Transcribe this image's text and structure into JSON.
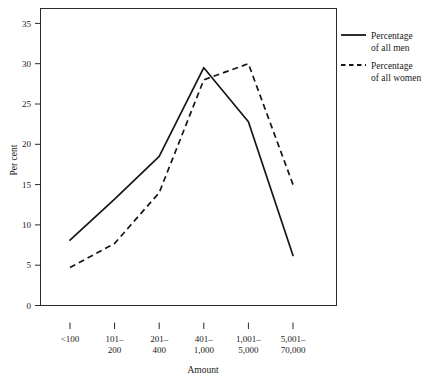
{
  "chart_data": {
    "type": "line",
    "title": "",
    "xlabel": "Amount",
    "ylabel": "Per cent",
    "categories": [
      "<100",
      "101–\n200",
      "201–\n400",
      "401–\n1,000",
      "1,001–\n5,000",
      "5,001–\n70,000"
    ],
    "categories_flat": [
      "<100",
      "101–200",
      "201–400",
      "401–1,000",
      "1,001–5,000",
      "5,001–70,000"
    ],
    "category_lines": [
      [
        "<100"
      ],
      [
        "101–",
        "200"
      ],
      [
        "201–",
        "400"
      ],
      [
        "401–",
        "1,000"
      ],
      [
        "1,001–",
        "5,000"
      ],
      [
        "5,001–",
        "70,000"
      ]
    ],
    "series": [
      {
        "name": "Percentage of all men",
        "style": "solid",
        "color": "#15151a",
        "values": [
          8.1,
          13.2,
          18.5,
          29.5,
          22.8,
          6.2
        ]
      },
      {
        "name": "Percentage of all women",
        "style": "dashed",
        "color": "#15151a",
        "values": [
          4.7,
          7.7,
          14.0,
          28.0,
          30.0,
          15.0
        ]
      }
    ],
    "ylim": [
      0,
      35
    ],
    "yticks": [
      0,
      5,
      10,
      15,
      20,
      25,
      30,
      35
    ],
    "ytick_labels": [
      "0",
      "5",
      "10",
      "15",
      "20",
      "25",
      "30",
      "35"
    ],
    "grid": false,
    "legend_position": "right"
  },
  "legend": {
    "entries": [
      {
        "label_line1": "Percentage",
        "label_line2": "of all men",
        "style": "solid"
      },
      {
        "label_line1": "Percentage",
        "label_line2": "of all women",
        "style": "dashed"
      }
    ]
  },
  "axes": {
    "x_title": "Amount",
    "y_title": "Per cent"
  }
}
